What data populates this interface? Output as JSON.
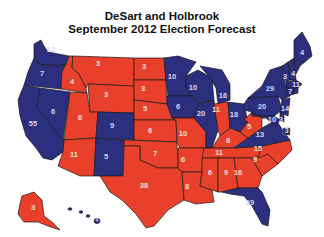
{
  "title": {
    "line1": "DeSart and Holbrook",
    "line2": "September 2012 Election Forecast"
  },
  "colors": {
    "democrat": "#2b2f7e",
    "republican": "#e8402a",
    "border": "#1a1a1a",
    "background": "#ffffff"
  },
  "legend": {
    "democrat": "Obama (blue)",
    "republican": "Romney (red)"
  },
  "states": {
    "WA": {
      "ev": "12",
      "party": "D"
    },
    "OR": {
      "ev": "7",
      "party": "D"
    },
    "CA": {
      "ev": "55",
      "party": "D"
    },
    "NV": {
      "ev": "6",
      "party": "D"
    },
    "ID": {
      "ev": "4",
      "party": "R"
    },
    "MT": {
      "ev": "3",
      "party": "R"
    },
    "WY": {
      "ev": "3",
      "party": "R"
    },
    "UT": {
      "ev": "6",
      "party": "R"
    },
    "AZ": {
      "ev": "11",
      "party": "R"
    },
    "CO": {
      "ev": "9",
      "party": "D"
    },
    "NM": {
      "ev": "5",
      "party": "D"
    },
    "ND": {
      "ev": "3",
      "party": "R"
    },
    "SD": {
      "ev": "3",
      "party": "R"
    },
    "NE": {
      "ev": "5",
      "party": "R"
    },
    "KS": {
      "ev": "6",
      "party": "R"
    },
    "OK": {
      "ev": "7",
      "party": "R"
    },
    "TX": {
      "ev": "38",
      "party": "R"
    },
    "MN": {
      "ev": "10",
      "party": "D"
    },
    "IA": {
      "ev": "6",
      "party": "D"
    },
    "MO": {
      "ev": "10",
      "party": "R"
    },
    "AR": {
      "ev": "6",
      "party": "R"
    },
    "LA": {
      "ev": "8",
      "party": "R"
    },
    "WI": {
      "ev": "10",
      "party": "D"
    },
    "IL": {
      "ev": "20",
      "party": "D"
    },
    "MI": {
      "ev": "16",
      "party": "D"
    },
    "IN": {
      "ev": "11",
      "party": "R"
    },
    "OH": {
      "ev": "18",
      "party": "D"
    },
    "KY": {
      "ev": "8",
      "party": "R"
    },
    "TN": {
      "ev": "11",
      "party": "R"
    },
    "MS": {
      "ev": "6",
      "party": "R"
    },
    "AL": {
      "ev": "9",
      "party": "R"
    },
    "GA": {
      "ev": "16",
      "party": "R"
    },
    "FL": {
      "ev": "29",
      "party": "D"
    },
    "SC": {
      "ev": "9",
      "party": "R"
    },
    "NC": {
      "ev": "15",
      "party": "R"
    },
    "VA": {
      "ev": "13",
      "party": "D"
    },
    "WV": {
      "ev": "5",
      "party": "R"
    },
    "PA": {
      "ev": "20",
      "party": "D"
    },
    "NY": {
      "ev": "29",
      "party": "D"
    },
    "VT": {
      "ev": "3",
      "party": "D"
    },
    "NH": {
      "ev": "4",
      "party": "D"
    },
    "ME": {
      "ev": "4",
      "party": "D"
    },
    "MA": {
      "ev": "11",
      "party": "D"
    },
    "CT": {
      "ev": "7",
      "party": "D"
    },
    "NJ": {
      "ev": "14",
      "party": "D"
    },
    "MD": {
      "ev": "10",
      "party": "D"
    },
    "DE": {
      "ev": "3",
      "party": "D"
    },
    "DC": {
      "ev": "3",
      "party": "D"
    },
    "AK": {
      "ev": "3",
      "party": "R"
    },
    "HI": {
      "ev": "4",
      "party": "D"
    }
  }
}
